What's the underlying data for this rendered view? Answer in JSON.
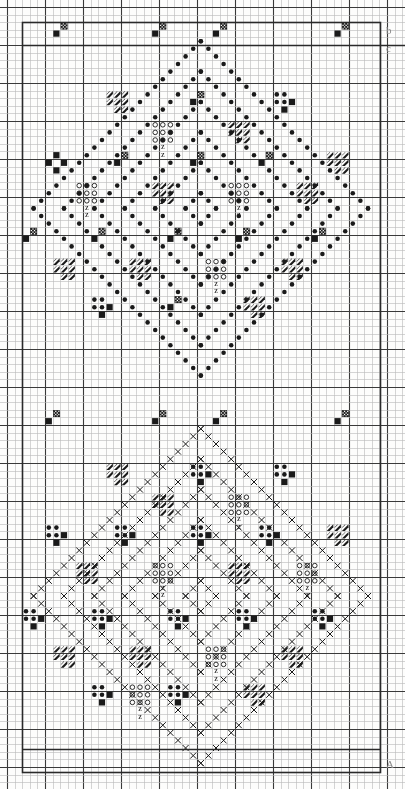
{
  "document": {
    "kind": "needlework-pattern-chart",
    "title": "Cross-stitch diamond pattern chart",
    "paper": "graph-paper",
    "background_color": "#fdfdfc",
    "ink_color": "#1a1a1a"
  },
  "grid": {
    "cell_px": 7.6,
    "origin_x": 7,
    "origin_y": 7,
    "cols": 52,
    "rows": 102,
    "minor_color": "#b9b9b9",
    "minor_width": 0.6,
    "major_color": "#3a3a3a",
    "major_width": 1.1,
    "major_every": 5
  },
  "frame": {
    "color": "#2a2a2a",
    "width": 1.6,
    "left_x": 22,
    "right_x": 380,
    "top_y": 22,
    "bottom_y": 772,
    "inner_top_y": 45,
    "inner_bottom_y": 749
  },
  "edge_marks": [
    {
      "name": "top-right-annotation",
      "label": "b",
      "x": 386,
      "y": 24
    },
    {
      "name": "upper-right-annotation",
      "label": "c",
      "x": 386,
      "y": 42
    },
    {
      "name": "bottom-right-annotation",
      "label": "A",
      "x": 386,
      "y": 758
    }
  ],
  "legend": {
    "symbols": [
      {
        "key": "filled-dot",
        "name": "filled-dot-symbol",
        "label": "●",
        "description": "solid round stitch"
      },
      {
        "key": "open-dot",
        "name": "open-dot-symbol",
        "label": "○",
        "description": "open round stitch"
      },
      {
        "key": "cross",
        "name": "cross-symbol",
        "label": "✕",
        "description": "cross stitch"
      },
      {
        "key": "solid-square",
        "name": "solid-square-symbol",
        "label": "■",
        "description": "filled square block"
      },
      {
        "key": "checker",
        "name": "checker-symbol",
        "label": "▨",
        "description": "checkered block"
      },
      {
        "key": "flag",
        "name": "flag-symbol",
        "label": "◢",
        "description": "diagonal flag / zigzag block"
      },
      {
        "key": "letter-z",
        "name": "letter-z-symbol",
        "label": "Z",
        "description": "small letter marker"
      }
    ]
  },
  "chart_data": {
    "type": "heatmap",
    "xlabel": "",
    "ylabel": "",
    "grid": true,
    "legend_position": "none",
    "categories": [],
    "values": [],
    "motifs": {
      "upper_diamond": {
        "name": "upper-diamond",
        "center_col": 25,
        "center_row": 26,
        "half_span": 22,
        "stitch": "filled-dot",
        "lines": [
          0,
          4,
          8,
          12,
          16,
          20
        ],
        "note": "nested diamond outlines drawn with solid round stitches"
      },
      "lower_diamond": {
        "name": "lower-diamond",
        "center_col": 25,
        "center_row": 77,
        "half_span": 22,
        "stitch": "cross",
        "lines": [
          0,
          4,
          8,
          12,
          16,
          20
        ],
        "note": "nested diamond outlines drawn with cross stitches"
      }
    },
    "blocks": [
      {
        "type": "checker",
        "col": 6,
        "row": 2
      },
      {
        "type": "checker",
        "col": 19,
        "row": 2
      },
      {
        "type": "checker",
        "col": 27,
        "row": 2
      },
      {
        "type": "checker",
        "col": 43,
        "row": 2
      },
      {
        "type": "checker",
        "col": 24,
        "row": 11
      },
      {
        "type": "flag",
        "col": 13,
        "row": 11
      },
      {
        "type": "dotcluster",
        "col": 35,
        "row": 11
      },
      {
        "type": "solidcross",
        "col": 5,
        "row": 19
      },
      {
        "type": "checker",
        "col": 14,
        "row": 19
      },
      {
        "type": "checker",
        "col": 24,
        "row": 19
      },
      {
        "type": "checker",
        "col": 33,
        "row": 19
      },
      {
        "type": "flag",
        "col": 42,
        "row": 19
      },
      {
        "type": "opencluster",
        "col": 19,
        "row": 15
      },
      {
        "type": "flag",
        "col": 29,
        "row": 15
      },
      {
        "type": "opencluster",
        "col": 9,
        "row": 23
      },
      {
        "type": "flag",
        "col": 19,
        "row": 23
      },
      {
        "type": "opencluster",
        "col": 29,
        "row": 23
      },
      {
        "type": "flag",
        "col": 38,
        "row": 23
      },
      {
        "type": "checker",
        "col": 2,
        "row": 29
      },
      {
        "type": "checker",
        "col": 11,
        "row": 29
      },
      {
        "type": "checker",
        "col": 21,
        "row": 29
      },
      {
        "type": "checker",
        "col": 30,
        "row": 29
      },
      {
        "type": "checker",
        "col": 40,
        "row": 29
      },
      {
        "type": "flag",
        "col": 6,
        "row": 33
      },
      {
        "type": "flag",
        "col": 16,
        "row": 33
      },
      {
        "type": "opencluster",
        "col": 26,
        "row": 33
      },
      {
        "type": "flag",
        "col": 36,
        "row": 33
      },
      {
        "type": "dotcluster",
        "col": 11,
        "row": 38
      },
      {
        "type": "checker",
        "col": 21,
        "row": 38
      },
      {
        "type": "flag",
        "col": 31,
        "row": 38
      },
      {
        "type": "checker",
        "col": 5,
        "row": 53
      },
      {
        "type": "checker",
        "col": 19,
        "row": 53
      },
      {
        "type": "checker",
        "col": 27,
        "row": 53
      },
      {
        "type": "checker",
        "col": 43,
        "row": 53
      },
      {
        "type": "dotcluster",
        "col": 24,
        "row": 60
      },
      {
        "type": "flag",
        "col": 13,
        "row": 60
      },
      {
        "type": "dotcluster",
        "col": 35,
        "row": 60
      },
      {
        "type": "dotcluster",
        "col": 5,
        "row": 68
      },
      {
        "type": "dotcluster",
        "col": 14,
        "row": 68
      },
      {
        "type": "dotcluster",
        "col": 24,
        "row": 68
      },
      {
        "type": "dotcluster",
        "col": 33,
        "row": 68
      },
      {
        "type": "flag",
        "col": 42,
        "row": 68
      },
      {
        "type": "flag",
        "col": 19,
        "row": 64
      },
      {
        "type": "opencluster",
        "col": 29,
        "row": 64
      },
      {
        "type": "flag",
        "col": 9,
        "row": 73
      },
      {
        "type": "opencluster",
        "col": 19,
        "row": 73
      },
      {
        "type": "flag",
        "col": 29,
        "row": 73
      },
      {
        "type": "opencluster",
        "col": 38,
        "row": 73
      },
      {
        "type": "dotcluster",
        "col": 2,
        "row": 79
      },
      {
        "type": "dotcluster",
        "col": 11,
        "row": 79
      },
      {
        "type": "dotcluster",
        "col": 21,
        "row": 79
      },
      {
        "type": "dotcluster",
        "col": 30,
        "row": 79
      },
      {
        "type": "dotcluster",
        "col": 40,
        "row": 79
      },
      {
        "type": "flag",
        "col": 6,
        "row": 84
      },
      {
        "type": "flag",
        "col": 16,
        "row": 84
      },
      {
        "type": "opencluster",
        "col": 26,
        "row": 84
      },
      {
        "type": "flag",
        "col": 36,
        "row": 84
      },
      {
        "type": "dotcluster",
        "col": 11,
        "row": 89
      },
      {
        "type": "dotcluster",
        "col": 21,
        "row": 89
      },
      {
        "type": "flag",
        "col": 31,
        "row": 89
      },
      {
        "type": "opencluster",
        "col": 16,
        "row": 89
      }
    ]
  }
}
